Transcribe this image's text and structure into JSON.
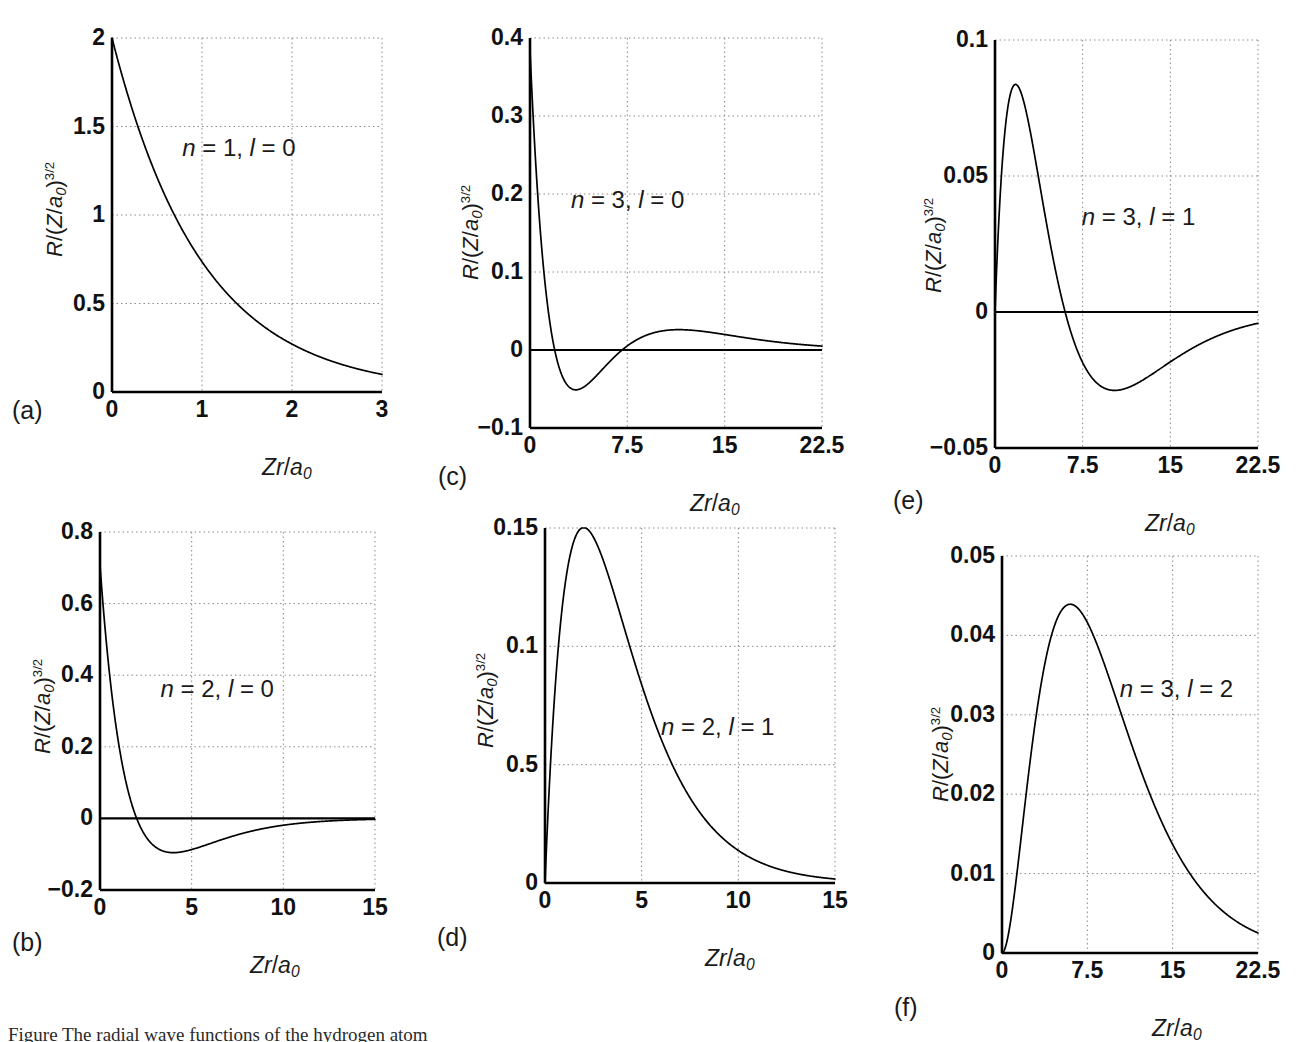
{
  "figure": {
    "axis_y_title_parts": {
      "r": "R",
      "slash": "/(",
      "z": "Z",
      "slash2": "/",
      "a": "a",
      "a_sub": "0",
      "close": ")",
      "exp": "3/2"
    },
    "axis_x_title_parts": {
      "zr": "Zr",
      "slash": "/",
      "a": "a",
      "a_sub": "0"
    },
    "caption": "Figure  The radial wave functions of the hydrogen atom"
  },
  "chart_data": [
    {
      "id": "a",
      "panel_label": "(a)",
      "type": "line",
      "title": "n = 1, l = 0",
      "annotation": {
        "n": "1",
        "l": "0",
        "text": "n = 1, l = 0"
      },
      "xlabel": "Zr/a0",
      "ylabel": "R/(Z/a0)^3/2",
      "xlim": [
        0,
        3
      ],
      "ylim": [
        0,
        2
      ],
      "xticks": [
        0,
        1,
        2,
        3
      ],
      "xtick_labels": [
        "0",
        "1",
        "2",
        "3"
      ],
      "yticks": [
        0,
        0.5,
        1,
        1.5,
        2
      ],
      "ytick_labels": [
        "0",
        "0.5",
        "1",
        "1.5",
        "2"
      ],
      "grid": true,
      "zero_line": false,
      "quantum_numbers": {
        "n": 1,
        "l": 1e-09
      },
      "key_points": {
        "value_at_0": 2.0,
        "value_at_1": 0.736,
        "value_at_2": 0.271,
        "value_at_3": 0.0996
      },
      "x": [
        0,
        0.25,
        0.5,
        0.75,
        1,
        1.25,
        1.5,
        1.75,
        2,
        2.25,
        2.5,
        2.75,
        3
      ],
      "values": [
        2.0,
        1.558,
        1.213,
        0.945,
        0.736,
        0.573,
        0.446,
        0.347,
        0.271,
        0.211,
        0.164,
        0.128,
        0.0996
      ]
    },
    {
      "id": "b",
      "panel_label": "(b)",
      "type": "line",
      "title": "n = 2, l = 0",
      "annotation": {
        "n": "2",
        "l": "0",
        "text": "n = 2, l = 0"
      },
      "xlabel": "Zr/a0",
      "ylabel": "R/(Z/a0)^3/2",
      "xlim": [
        0,
        15
      ],
      "ylim": [
        -0.2,
        0.8
      ],
      "xticks": [
        0,
        5,
        10,
        15
      ],
      "xtick_labels": [
        "0",
        "5",
        "10",
        "15"
      ],
      "yticks": [
        -0.2,
        0,
        0.2,
        0.4,
        0.6,
        0.8
      ],
      "ytick_labels": [
        "-0.2",
        "0",
        "0.2",
        "0.4",
        "0.6",
        "0.8"
      ],
      "grid": true,
      "zero_line": true,
      "quantum_numbers": {
        "n": 2,
        "l": 0
      },
      "key_points": {
        "value_at_0": 0.707,
        "node_at": 2.0,
        "minimum": -0.105,
        "minimum_at": 4.0
      },
      "x": [
        0,
        0.5,
        1,
        1.5,
        2,
        3,
        4,
        5,
        6,
        7,
        8,
        9,
        10,
        12,
        15
      ],
      "values": [
        0.707,
        0.413,
        0.214,
        0.0836,
        0.0,
        -0.0558,
        -0.0957,
        -0.097,
        -0.088,
        -0.0746,
        -0.0605,
        -0.0473,
        -0.0358,
        -0.0189,
        -0.0058
      ]
    },
    {
      "id": "c",
      "panel_label": "(c)",
      "type": "line",
      "title": "n = 3, l = 0",
      "annotation": {
        "n": "3",
        "l": "0",
        "text": "n = 3, l = 0"
      },
      "xlabel": "Zr/a0",
      "ylabel": "R/(Z/a0)^3/2",
      "xlim": [
        0,
        22.5
      ],
      "ylim": [
        -0.1,
        0.4
      ],
      "xticks": [
        0,
        7.5,
        15,
        22.5
      ],
      "xtick_labels": [
        "0",
        "7.5",
        "15",
        "22.5"
      ],
      "yticks": [
        -0.1,
        0,
        0.1,
        0.2,
        0.3,
        0.4
      ],
      "ytick_labels": [
        "-0.1",
        "0",
        "0.1",
        "0.2",
        "0.3",
        "0.4"
      ],
      "grid": true,
      "zero_line": true,
      "quantum_numbers": {
        "n": 3,
        "l": 0
      },
      "key_points": {
        "value_at_0": 0.385,
        "first_node": 1.9,
        "minimum": -0.062,
        "minimum_at": 3.4,
        "second_node": 7.1,
        "secondary_max": 0.019,
        "secondary_max_at": 11.5
      },
      "x": [
        0,
        1,
        2,
        3,
        4,
        5,
        6,
        7,
        7.5,
        9,
        11,
        13,
        15,
        18,
        22.5
      ],
      "values": [
        0.385,
        0.114,
        -0.0095,
        -0.0595,
        -0.0619,
        -0.0479,
        -0.0299,
        -0.0129,
        -0.0057,
        0.0112,
        0.0187,
        0.0184,
        0.0151,
        0.0089,
        0.0027
      ]
    },
    {
      "id": "d",
      "panel_label": "(d)",
      "type": "line",
      "title": "n = 2, l = 1",
      "annotation": {
        "n": "2",
        "l": "1",
        "text": "n = 2, l = 1"
      },
      "xlabel": "Zr/a0",
      "ylabel": "R/(Z/a0)^3/2",
      "xlim": [
        0,
        15
      ],
      "ylim": [
        0,
        0.15
      ],
      "xticks": [
        0,
        5,
        10,
        15
      ],
      "xtick_labels": [
        "0",
        "5",
        "10",
        "15"
      ],
      "yticks": [
        0,
        0.05,
        0.1,
        0.15
      ],
      "ytick_labels": [
        "0",
        "0.5",
        "0.1",
        "0.15"
      ],
      "grid": true,
      "zero_line": false,
      "quantum_numbers": {
        "n": 2,
        "l": 1
      },
      "key_points": {
        "maximum": 0.15,
        "maximum_at": 2.0,
        "value_at_5": 0.0838,
        "value_at_10": 0.0136
      },
      "x": [
        0,
        0.5,
        1,
        1.5,
        2,
        2.5,
        3,
        4,
        5,
        6,
        7,
        8,
        10,
        12,
        15
      ],
      "values": [
        0.0,
        0.0795,
        0.1238,
        0.1445,
        0.1502,
        0.1464,
        0.1367,
        0.1106,
        0.0838,
        0.061,
        0.0432,
        0.03,
        0.0139,
        0.0062,
        0.0017
      ]
    },
    {
      "id": "e",
      "panel_label": "(e)",
      "type": "line",
      "title": "n = 3, l = 1",
      "annotation": {
        "n": "3",
        "l": "1",
        "text": "n = 3, l = 1"
      },
      "xlabel": "Zr/a0",
      "ylabel": "R/(Z/a0)^3/2",
      "xlim": [
        0,
        22.5
      ],
      "ylim": [
        -0.05,
        0.1
      ],
      "xticks": [
        0,
        7.5,
        15,
        22.5
      ],
      "xtick_labels": [
        "0",
        "7.5",
        "15",
        "22.5"
      ],
      "yticks": [
        -0.05,
        0,
        0.05,
        0.1
      ],
      "ytick_labels": [
        "-0.05",
        "0",
        "0.05",
        "0.1"
      ],
      "grid": true,
      "zero_line": true,
      "quantum_numbers": {
        "n": 3,
        "l": 1
      },
      "key_points": {
        "maximum": 0.0744,
        "maximum_at": 2.0,
        "node_at": 6.0,
        "minimum": -0.0224,
        "minimum_at": 9.7
      },
      "x": [
        0,
        1,
        2,
        3,
        4,
        5,
        6,
        7,
        7.5,
        9,
        10,
        12,
        15,
        18,
        22.5
      ],
      "values": [
        0.0,
        0.0577,
        0.0744,
        0.07,
        0.0552,
        0.0372,
        0.0197,
        0.0053,
        -0.0004,
        -0.012,
        -0.0151,
        -0.0176,
        -0.0148,
        -0.0097,
        -0.004
      ]
    },
    {
      "id": "f",
      "panel_label": "(f)",
      "type": "line",
      "title": "n = 3, l = 2",
      "annotation": {
        "n": "3",
        "l": "2",
        "text": "n = 3, l = 2"
      },
      "xlabel": "Zr/a0",
      "ylabel": "R/(Z/a0)^3/2",
      "xlim": [
        0,
        22.5
      ],
      "ylim": [
        0,
        0.05
      ],
      "xticks": [
        0,
        7.5,
        15,
        22.5
      ],
      "xtick_labels": [
        "0",
        "7.5",
        "15",
        "22.5"
      ],
      "yticks": [
        0,
        0.01,
        0.02,
        0.03,
        0.04,
        0.05
      ],
      "ytick_labels": [
        "0",
        "0.01",
        "0.02",
        "0.03",
        "0.04",
        "0.05"
      ],
      "grid": true,
      "zero_line": false,
      "quantum_numbers": {
        "n": 3,
        "l": 2
      },
      "key_points": {
        "maximum": 0.0441,
        "maximum_at": 6.8,
        "value_at_15": 0.0152,
        "value_at_22_5": 0.0025
      },
      "x": [
        0,
        1,
        2,
        3,
        4,
        5,
        6,
        7,
        7.5,
        9,
        11,
        13,
        15,
        18,
        22.5
      ],
      "values": [
        0.0,
        0.0022,
        0.0081,
        0.0164,
        0.0254,
        0.0335,
        0.0398,
        0.0435,
        0.0441,
        0.0421,
        0.0339,
        0.0248,
        0.0168,
        0.0086,
        0.0025
      ]
    }
  ]
}
